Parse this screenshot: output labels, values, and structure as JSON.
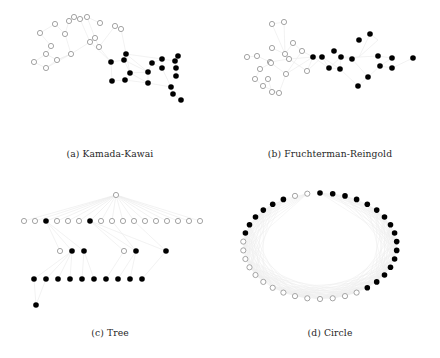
{
  "figure": {
    "type": "graph-layout-comparison",
    "width": 440,
    "height": 358,
    "background": "#ffffff",
    "node_colors": {
      "filled": "#000000",
      "open_stroke": "#9a9a9a",
      "open_fill": "#ffffff"
    },
    "edge_color": "#ededed",
    "node_radius": 2.6
  },
  "subfigures": [
    {
      "id": "a",
      "label": "(a)",
      "caption": "(a) Kamada-Kawai",
      "name": "Kamada-Kawai"
    },
    {
      "id": "b",
      "label": "(b)",
      "caption": "(b) Fruchterman-Reingold",
      "name": "Fruchterman-Reingold"
    },
    {
      "id": "c",
      "label": "(c)",
      "caption": "(c) Tree",
      "name": "Tree"
    },
    {
      "id": "d",
      "label": "(d)",
      "caption": "(d) Circle",
      "name": "Circle"
    }
  ],
  "chart_data": [
    {
      "type": "scatter",
      "id": "kamada-kawai",
      "title": "(a) Kamada-Kawai",
      "xlabel": "",
      "ylabel": "",
      "grid": false,
      "legend": null,
      "xlim": [
        0,
        220
      ],
      "ylim": [
        0,
        148
      ],
      "series": [
        {
          "name": "open-nodes",
          "marker": "open-circle",
          "points": [
            [
              40,
              33
            ],
            [
              51,
              46
            ],
            [
              55,
              24
            ],
            [
              65,
              34
            ],
            [
              69,
              21
            ],
            [
              74,
              17
            ],
            [
              80,
              19
            ],
            [
              87,
              17
            ],
            [
              46,
              54
            ],
            [
              57,
              60
            ],
            [
              71,
              54
            ],
            [
              90,
              42
            ],
            [
              95,
              38
            ],
            [
              99,
              47
            ],
            [
              115,
              26
            ],
            [
              121,
              29
            ],
            [
              34,
              62
            ],
            [
              46,
              68
            ],
            [
              100,
              23
            ]
          ]
        },
        {
          "name": "filled-nodes",
          "marker": "filled-circle",
          "points": [
            [
              124,
              60
            ],
            [
              126,
              54
            ],
            [
              111,
              62
            ],
            [
              130,
              73
            ],
            [
              148,
              72
            ],
            [
              152,
              63
            ],
            [
              162,
              59
            ],
            [
              175,
              61
            ],
            [
              176,
              68
            ],
            [
              176,
              76
            ],
            [
              178,
              56
            ],
            [
              112,
              81
            ],
            [
              125,
              80
            ],
            [
              148,
              83
            ],
            [
              171,
              87
            ],
            [
              173,
              94
            ],
            [
              181,
              100
            ],
            [
              162,
              68
            ]
          ]
        }
      ],
      "edges_visible": true,
      "edges_note": "very faint light-gray connecting lines between nodes"
    },
    {
      "type": "scatter",
      "id": "fruchterman-reingold",
      "title": "(b) Fruchterman-Reingold",
      "xlabel": "",
      "ylabel": "",
      "grid": false,
      "legend": null,
      "xlim": [
        0,
        220
      ],
      "ylim": [
        0,
        148
      ],
      "series": [
        {
          "name": "open-nodes",
          "marker": "open-circle",
          "points": [
            [
              272,
              24
            ],
            [
              284,
              22
            ],
            [
              285,
              54
            ],
            [
              272,
              48
            ],
            [
              293,
              43
            ],
            [
              302,
              51
            ],
            [
              247,
              57
            ],
            [
              257,
              56
            ],
            [
              270,
              62
            ],
            [
              271,
              63
            ],
            [
              260,
              69
            ],
            [
              255,
              79
            ],
            [
              263,
              86
            ],
            [
              268,
              79
            ],
            [
              272,
              92
            ],
            [
              279,
              93
            ],
            [
              289,
              59
            ],
            [
              307,
              71
            ],
            [
              286,
              74
            ]
          ]
        },
        {
          "name": "filled-nodes",
          "marker": "filled-circle",
          "points": [
            [
              370,
              34
            ],
            [
              359,
              40
            ],
            [
              334,
              51
            ],
            [
              341,
              57
            ],
            [
              352,
              59
            ],
            [
              378,
              56
            ],
            [
              392,
              58
            ],
            [
              313,
              57
            ],
            [
              322,
              57
            ],
            [
              329,
              68
            ],
            [
              340,
              69
            ],
            [
              380,
              66
            ],
            [
              392,
              68
            ],
            [
              413,
              58
            ],
            [
              368,
              77
            ],
            [
              358,
              86
            ]
          ]
        }
      ],
      "edges_visible": true,
      "edges_note": "very faint light-gray connecting lines between nodes"
    },
    {
      "type": "scatter",
      "id": "tree",
      "title": "(c) Tree",
      "xlabel": "",
      "ylabel": "",
      "grid": false,
      "legend": null,
      "xlim": [
        0,
        220
      ],
      "ylim": [
        0,
        148
      ],
      "levels": [
        {
          "level": 0,
          "y": 196,
          "count": 1,
          "filled_index": []
        },
        {
          "level": 1,
          "y": 222,
          "count": 16,
          "filled_index": [
            2,
            6
          ]
        },
        {
          "level": 2,
          "y": 252,
          "count": 7,
          "filled_index": [
            1,
            2,
            4,
            5,
            6
          ]
        },
        {
          "level": 3,
          "y": 280,
          "count": 10,
          "filled_index": [
            0,
            1,
            2,
            3,
            4,
            5,
            6,
            7,
            8,
            9
          ]
        },
        {
          "level": 4,
          "y": 306,
          "count": 1,
          "filled_index": [
            0
          ]
        }
      ],
      "series": [
        {
          "name": "open-nodes",
          "marker": "open-circle",
          "points": [
            [
              116,
              196
            ],
            [
              24,
              222
            ],
            [
              35,
              222
            ],
            [
              57,
              222
            ],
            [
              68,
              222
            ],
            [
              79,
              222
            ],
            [
              101,
              222
            ],
            [
              112,
              222
            ],
            [
              123,
              222
            ],
            [
              134,
              222
            ],
            [
              145,
              222
            ],
            [
              156,
              222
            ],
            [
              167,
              222
            ],
            [
              178,
              222
            ],
            [
              189,
              222
            ],
            [
              200,
              222
            ],
            [
              60,
              252
            ],
            [
              124,
              252
            ]
          ]
        },
        {
          "name": "filled-nodes",
          "marker": "filled-circle",
          "points": [
            [
              46,
              222
            ],
            [
              90,
              222
            ],
            [
              72,
              252
            ],
            [
              84,
              252
            ],
            [
              136,
              252
            ],
            [
              166,
              252
            ],
            [
              34,
              280
            ],
            [
              46,
              280
            ],
            [
              58,
              280
            ],
            [
              70,
              280
            ],
            [
              82,
              280
            ],
            [
              94,
              280
            ],
            [
              106,
              280
            ],
            [
              118,
              280
            ],
            [
              130,
              280
            ],
            [
              142,
              280
            ],
            [
              36,
              306
            ]
          ]
        }
      ],
      "edges_visible": true,
      "edges_note": "faint gray tree edges fanning from the root down to each level"
    },
    {
      "type": "scatter",
      "id": "circle",
      "title": "(d) Circle",
      "xlabel": "",
      "ylabel": "",
      "grid": false,
      "legend": null,
      "layout": "ellipse",
      "center": [
        330,
        252
      ],
      "radius_x": 77,
      "radius_y": 53,
      "node_count": 38,
      "filled_node_indices": [
        0,
        1,
        2,
        3,
        4,
        5,
        6,
        7,
        8,
        9,
        10,
        11,
        12,
        13,
        14,
        15,
        30,
        31,
        32,
        33,
        34,
        35
      ],
      "open_node_indices": [
        16,
        17,
        18,
        19,
        20,
        21,
        22,
        23,
        24,
        25,
        26,
        27,
        28,
        29,
        36,
        37
      ],
      "edges_visible": true,
      "edges_note": "dense faint gray chords across the interior of the ellipse"
    }
  ]
}
